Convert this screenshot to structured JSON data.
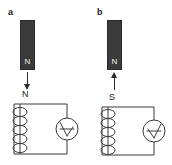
{
  "figure": {
    "background_color": "#ffffff",
    "ink_color": "#3a3a3a",
    "magnet_color": "#3a3a3a",
    "magnet_text_color": "#f2f2f2",
    "width": 172,
    "height": 165
  },
  "panels": [
    {
      "id": "a",
      "label": "a",
      "magnet": {
        "pole_label": "N",
        "name": "bar-magnet"
      },
      "motion_arrow": {
        "direction": "down",
        "meaning": "magnet moving toward coil"
      },
      "coil_pole_label": "N",
      "coil": {
        "turns": 5,
        "name": "solenoid-coil"
      },
      "meter": {
        "name": "galvanometer",
        "needle_direction": "left"
      }
    },
    {
      "id": "b",
      "label": "b",
      "magnet": {
        "pole_label": "N",
        "name": "bar-magnet"
      },
      "motion_arrow": {
        "direction": "up",
        "meaning": "magnet moving away from coil"
      },
      "coil_pole_label": "S",
      "coil": {
        "turns": 5,
        "name": "solenoid-coil"
      },
      "meter": {
        "name": "galvanometer",
        "needle_direction": "right"
      }
    }
  ]
}
